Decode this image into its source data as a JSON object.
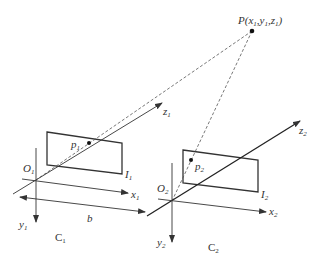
{
  "diagram": {
    "type": "stereo-vision-geometry",
    "point": {
      "label": "P",
      "coords_text": "(x",
      "sub1": "1",
      "y": ",y",
      "sub2": "1",
      "z": ",z",
      "sub3": "1",
      "close": ")"
    },
    "camera1": {
      "name": "C",
      "name_sub": "1",
      "origin": "O",
      "origin_sub": "1",
      "image_plane": "I",
      "image_plane_sub": "1",
      "image_point": "p",
      "image_point_sub": "1",
      "x_axis": "x",
      "x_sub": "1",
      "y_axis": "y",
      "y_sub": "1",
      "z_axis": "z",
      "z_sub": "1"
    },
    "camera2": {
      "name": "C",
      "name_sub": "2",
      "origin": "O",
      "origin_sub": "2",
      "image_plane": "I",
      "image_plane_sub": "2",
      "image_point": "p",
      "image_point_sub": "2",
      "x_axis": "x",
      "x_sub": "2",
      "y_axis": "y",
      "y_sub": "2",
      "z_axis": "z",
      "z_sub": "2"
    },
    "baseline": {
      "label": "b"
    },
    "colors": {
      "line": "#333333",
      "dashed": "#555555",
      "background": "#ffffff"
    }
  }
}
